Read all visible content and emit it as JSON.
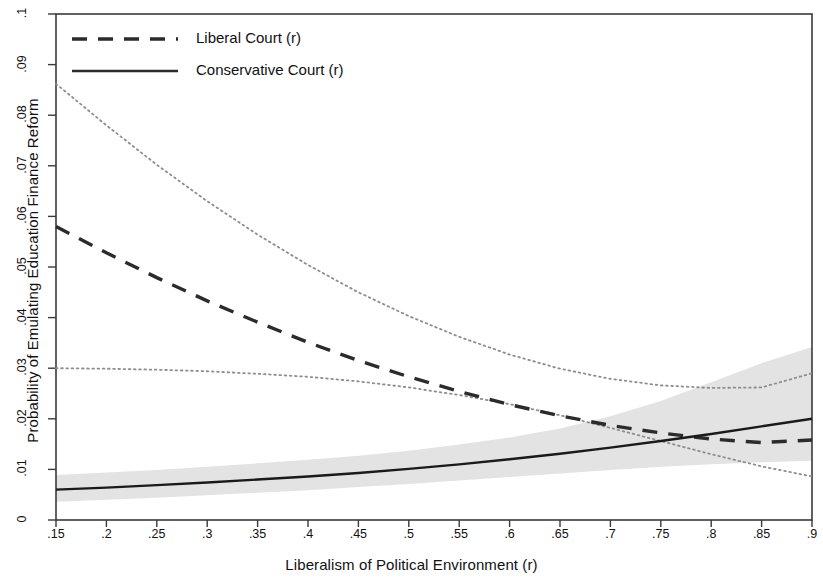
{
  "chart_data": {
    "type": "line",
    "title": "",
    "xlabel": "Liberalism of Political Environment (r)",
    "ylabel": "Probability of Emulating Education Finance Reform",
    "xlim": [
      0.15,
      0.9
    ],
    "ylim": [
      0,
      0.1
    ],
    "grid": false,
    "legend_position": "top-left",
    "xticks": [
      ".15",
      ".2",
      ".25",
      ".3",
      ".35",
      ".4",
      ".45",
      ".5",
      ".55",
      ".6",
      ".65",
      ".7",
      ".75",
      ".8",
      ".85",
      ".9"
    ],
    "xtick_values": [
      0.15,
      0.2,
      0.25,
      0.3,
      0.35,
      0.4,
      0.45,
      0.5,
      0.55,
      0.6,
      0.65,
      0.7,
      0.75,
      0.8,
      0.85,
      0.9
    ],
    "yticks": [
      "0",
      ".01",
      ".02",
      ".03",
      ".04",
      ".05",
      ".06",
      ".07",
      ".08",
      ".09",
      ".1"
    ],
    "ytick_values": [
      0,
      0.01,
      0.02,
      0.03,
      0.04,
      0.05,
      0.06,
      0.07,
      0.08,
      0.09,
      0.1
    ],
    "x": [
      0.15,
      0.2,
      0.25,
      0.3,
      0.35,
      0.4,
      0.45,
      0.5,
      0.55,
      0.6,
      0.65,
      0.7,
      0.75,
      0.8,
      0.85,
      0.9
    ],
    "series": [
      {
        "name": "Liberal Court (r)",
        "style": "dashed",
        "color": "#2b2b2b",
        "values": [
          0.058,
          0.0528,
          0.0479,
          0.0433,
          0.0391,
          0.0351,
          0.0315,
          0.0283,
          0.0254,
          0.0228,
          0.0206,
          0.0187,
          0.0172,
          0.016,
          0.0153,
          0.0158
        ],
        "ci_upper": {
          "name": "Liberal Court upper 95% CI",
          "style": "dotted",
          "values": [
            0.0862,
            0.078,
            0.0702,
            0.063,
            0.0564,
            0.0504,
            0.045,
            0.0403,
            0.0362,
            0.0327,
            0.0299,
            0.0279,
            0.0266,
            0.0261,
            0.0262,
            0.029
          ]
        },
        "ci_lower": {
          "name": "Liberal Court lower 95% CI",
          "style": "dotted",
          "values": [
            0.03,
            0.0299,
            0.0297,
            0.0294,
            0.0289,
            0.0283,
            0.0274,
            0.0262,
            0.0247,
            0.0229,
            0.0207,
            0.0182,
            0.0156,
            0.013,
            0.0106,
            0.0086
          ]
        }
      },
      {
        "name": "Conservative Court (r)",
        "style": "solid",
        "color": "#1a1a1a",
        "values": [
          0.006,
          0.0064,
          0.0069,
          0.0074,
          0.008,
          0.0086,
          0.0093,
          0.0101,
          0.011,
          0.012,
          0.0131,
          0.0143,
          0.0156,
          0.017,
          0.0185,
          0.02
        ],
        "band_upper": {
          "name": "Conservative Court upper 95% band",
          "values": [
            0.0089,
            0.0094,
            0.0099,
            0.0105,
            0.0112,
            0.0119,
            0.0127,
            0.0137,
            0.0149,
            0.0163,
            0.0181,
            0.0205,
            0.0235,
            0.0272,
            0.031,
            0.0342
          ]
        },
        "band_lower": {
          "name": "Conservative Court lower 95% band",
          "values": [
            0.0036,
            0.004,
            0.0044,
            0.0049,
            0.0054,
            0.0059,
            0.0065,
            0.0071,
            0.0078,
            0.0085,
            0.0092,
            0.0099,
            0.0105,
            0.011,
            0.0114,
            0.0117
          ]
        },
        "band_color": "#dedede"
      }
    ],
    "legend": [
      {
        "label": "Liberal Court (r)",
        "style": "dashed"
      },
      {
        "label": "Conservative Court (r)",
        "style": "solid"
      }
    ]
  },
  "axes": {
    "x_title": "Liberalism of Political Environment (r)",
    "y_title": "Probability of Emulating Education Finance Reform"
  }
}
